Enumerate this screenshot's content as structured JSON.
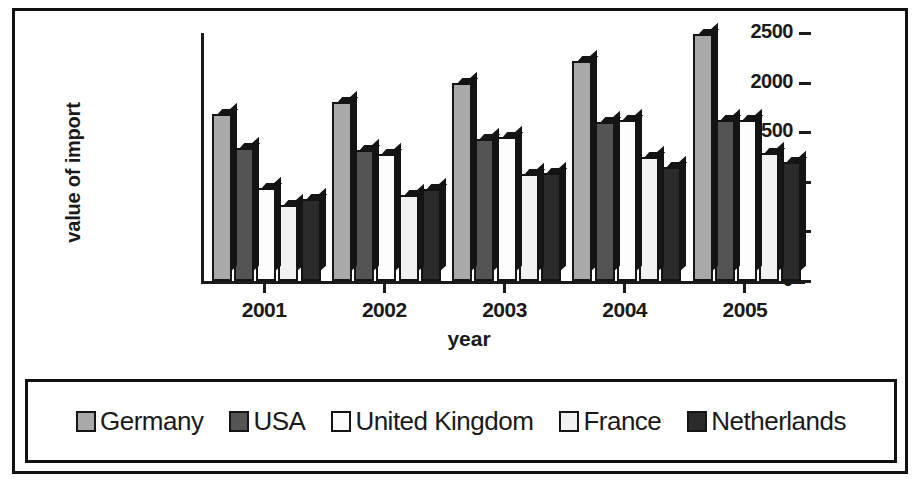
{
  "figure": {
    "background_color": "#ffffff",
    "frame_color": "#111111"
  },
  "chart_data": {
    "type": "bar",
    "title": "",
    "xlabel": "year",
    "ylabel": "value of import",
    "categories": [
      "2001",
      "2002",
      "2003",
      "2004",
      "2005"
    ],
    "ylim": [
      0,
      2500
    ],
    "yticks": [
      0,
      500,
      1000,
      1500,
      2000,
      2500
    ],
    "grid": false,
    "legend_position": "bottom",
    "series": [
      {
        "name": "Germany",
        "color": "#a9a9a9",
        "values": [
          1680,
          1800,
          2000,
          2220,
          2490
        ]
      },
      {
        "name": "USA",
        "color": "#545454",
        "values": [
          1340,
          1320,
          1430,
          1600,
          1620
        ]
      },
      {
        "name": "United Kingdom",
        "color": "#fdfdfd",
        "values": [
          940,
          1280,
          1450,
          1620,
          1620
        ]
      },
      {
        "name": "France",
        "color": "#f2f2f2",
        "values": [
          770,
          870,
          1080,
          1250,
          1290
        ]
      },
      {
        "name": "Netherlands",
        "color": "#2b2b2b",
        "values": [
          830,
          930,
          1090,
          1150,
          1200
        ]
      }
    ]
  },
  "axis": {
    "ytick_labels": [
      "2500",
      "2000",
      "1500",
      "1000",
      "500",
      "0"
    ],
    "xtick_labels": [
      "2001",
      "2002",
      "2003",
      "2004",
      "2005"
    ]
  },
  "legend": {
    "items": [
      {
        "label": "Germany",
        "color": "#a9a9a9"
      },
      {
        "label": "USA",
        "color": "#545454"
      },
      {
        "label": "United Kingdom",
        "color": "#fdfdfd"
      },
      {
        "label": "France",
        "color": "#f2f2f2"
      },
      {
        "label": "Netherlands",
        "color": "#2b2b2b"
      }
    ]
  }
}
